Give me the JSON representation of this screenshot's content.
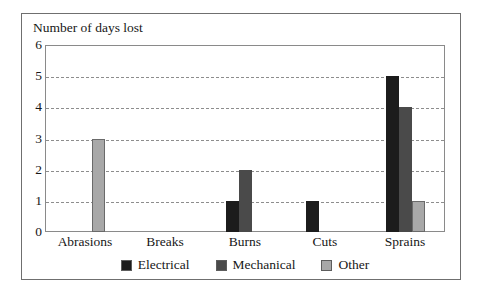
{
  "chart_data": {
    "type": "bar",
    "title": "Number of days lost",
    "xlabel": "",
    "ylabel": "Number of days lost",
    "categories": [
      "Abrasions",
      "Breaks",
      "Burns",
      "Cuts",
      "Sprains"
    ],
    "series": [
      {
        "name": "Electrical",
        "color": "#1c1c1c",
        "values": [
          0,
          0,
          1,
          1,
          5
        ]
      },
      {
        "name": "Mechanical",
        "color": "#4a4a4a",
        "values": [
          0,
          0,
          2,
          0,
          4
        ]
      },
      {
        "name": "Other",
        "color": "#a8a8a8",
        "values": [
          3,
          0,
          0,
          0,
          1
        ]
      }
    ],
    "yticks": [
      0,
      1,
      2,
      3,
      4,
      5,
      6
    ],
    "ylim": [
      0,
      6
    ],
    "grid": true,
    "gridlines_at": [
      1,
      2,
      3,
      4,
      5
    ],
    "legend_position": "bottom"
  },
  "legend": {
    "entries": [
      {
        "label": "Electrical"
      },
      {
        "label": "Mechanical"
      },
      {
        "label": "Other"
      }
    ]
  }
}
